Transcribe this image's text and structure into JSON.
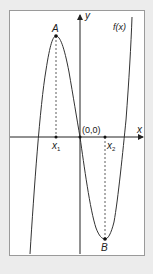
{
  "diagram": {
    "type": "function-graph",
    "function_label": "f(x)",
    "axes": {
      "x_label": "x",
      "y_label": "y",
      "origin_label": "(0,0)"
    },
    "points": {
      "A": {
        "label": "A",
        "description": "local maximum"
      },
      "B": {
        "label": "B",
        "description": "local minimum"
      }
    },
    "ticks": {
      "x1": {
        "base": "x",
        "sub": "1"
      },
      "x2": {
        "base": "x",
        "sub": "2"
      }
    },
    "colors": {
      "background": "#ececec",
      "panel": "#ffffff",
      "curve": "#333333",
      "axis": "#222222"
    }
  }
}
